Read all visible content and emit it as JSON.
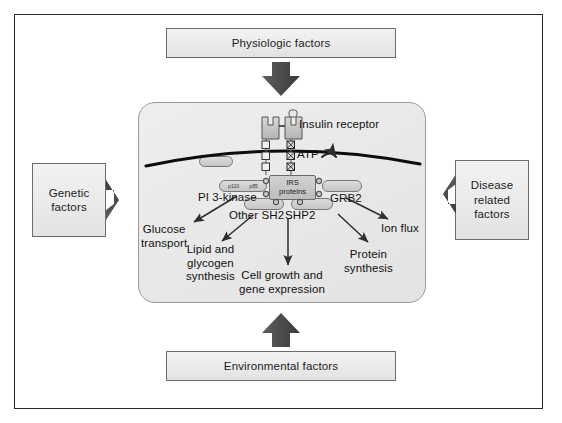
{
  "diagram": {
    "inputs": {
      "top": "Physiologic factors",
      "bottom": "Environmental factors",
      "left": "Genetic\nfactors",
      "left_line1": "Genetic",
      "left_line2": "factors",
      "right_line1": "Disease",
      "right_line2": "related",
      "right_line3": "factors"
    },
    "cell": {
      "receptor_label": "Insulin receptor",
      "atp_label": "ATP",
      "irs_line1": "IRS",
      "irs_line2": "proteins",
      "pi3k_label": "PI 3-kinase",
      "pi3k_sub_left": "p110",
      "pi3k_sub_right": "p85",
      "grb2_label": "GRB2",
      "other_sh2_label": "Other SH2",
      "shp2_label": "SHP2"
    },
    "outputs": [
      {
        "id": "glucose",
        "line1": "Glucose",
        "line2": "transport",
        "line3": ""
      },
      {
        "id": "lipid",
        "line1": "Lipid and",
        "line2": "glycogen",
        "line3": "synthesis"
      },
      {
        "id": "cellgrowth",
        "line1": "Cell growth and",
        "line2": "gene expression",
        "line3": ""
      },
      {
        "id": "protein",
        "line1": "Protein",
        "line2": "synthesis",
        "line3": ""
      },
      {
        "id": "ionflux",
        "line1": "Ion flux",
        "line2": "",
        "line3": ""
      }
    ],
    "colors": {
      "frame_border": "#2a2a2a",
      "box_fill": "#ededed",
      "box_border": "#6d6d6d",
      "cell_fill": "#e9e9e9",
      "cell_border": "#9a9a9a",
      "membrane": "#0d0d0d",
      "arrow": "#333333",
      "capsule_fill": "#cfcfcf"
    }
  }
}
